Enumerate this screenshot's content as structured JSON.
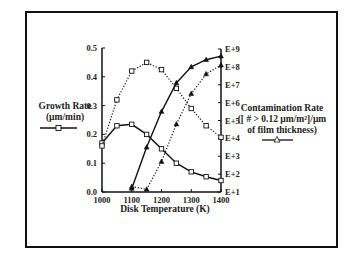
{
  "chart_data": {
    "type": "line",
    "title": "",
    "xlabel": "Disk Temperature (K)",
    "ylabel_left": "Growth Rate (µm/min)",
    "ylabel_right": "Contamination Rate ([# > 0.12 µm/m²]/µm of film thickness)",
    "x": [
      1000,
      1050,
      1100,
      1150,
      1200,
      1250,
      1300,
      1350,
      1400
    ],
    "xlim": [
      1000,
      1400
    ],
    "ylim_left": [
      0.0,
      0.5
    ],
    "ylim_right_log10": [
      1,
      9
    ],
    "x_ticks": [
      "1000",
      "1100",
      "1200",
      "1300",
      "1400"
    ],
    "y_left_ticks": [
      "0.0",
      "0.1",
      "0.2",
      "0.3",
      "0.4",
      "0.5"
    ],
    "y_right_ticks": [
      "E+1",
      "E+2",
      "E+3",
      "E+4",
      "E+5",
      "E+6",
      "E+7",
      "E+8",
      "E+9"
    ],
    "grid": false,
    "series": [
      {
        "name": "Growth Rate (solid)",
        "axis": "left",
        "marker": "square",
        "style": "solid",
        "values": [
          0.17,
          0.23,
          0.235,
          0.2,
          0.15,
          0.1,
          0.07,
          0.053,
          0.04
        ]
      },
      {
        "name": "Growth Rate (dotted)",
        "axis": "left",
        "marker": "square",
        "style": "dotted",
        "values": [
          0.16,
          0.32,
          0.42,
          0.45,
          0.425,
          0.36,
          0.29,
          0.23,
          0.19
        ]
      },
      {
        "name": "Contamination Rate (solid)",
        "axis": "right",
        "marker": "triangle",
        "style": "solid",
        "x": [
          1100,
          1150,
          1200,
          1250,
          1300,
          1350,
          1400
        ],
        "log10_values": [
          1.2,
          3.5,
          5.5,
          7.1,
          8.0,
          8.4,
          8.6
        ]
      },
      {
        "name": "Contamination Rate (dotted)",
        "axis": "right",
        "marker": "triangle",
        "style": "dotted",
        "x": [
          1100,
          1150,
          1200,
          1250,
          1300,
          1350,
          1400
        ],
        "log10_values": [
          1.3,
          1.15,
          2.7,
          4.8,
          6.5,
          7.6,
          8.1
        ]
      }
    ]
  },
  "labels": {
    "growth_line1": "Growth Rate",
    "growth_line2": "(µm/min)",
    "contam_line1": "Contamination Rate",
    "contam_line2": "([ # > 0.12 µm/m²]/µm",
    "contam_line3": "of film thickness)",
    "xlabel": "Disk Temperature (K)"
  }
}
